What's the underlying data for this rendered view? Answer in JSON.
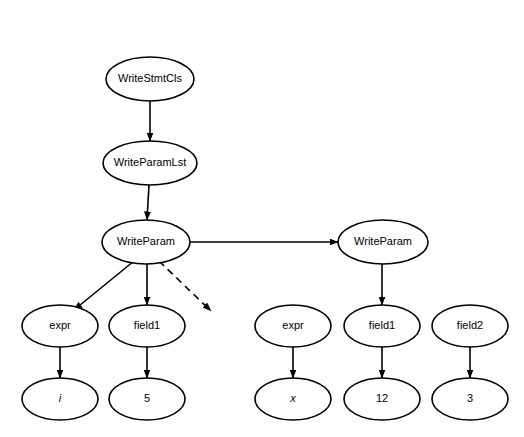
{
  "diagram": {
    "background_color": "#ffffff",
    "stroke_color": "#000000",
    "nodes": [
      {
        "id": "write_stmt_cls",
        "label": "WriteStmtCls",
        "cx": 150,
        "cy": 79,
        "rx": 44,
        "ry": 22,
        "italic": false
      },
      {
        "id": "write_param_lst",
        "label": "WriteParamLst",
        "cx": 150,
        "cy": 163,
        "rx": 47,
        "ry": 22,
        "italic": false
      },
      {
        "id": "write_param_1",
        "label": "WriteParam",
        "cx": 146,
        "cy": 242,
        "rx": 44,
        "ry": 22,
        "italic": false
      },
      {
        "id": "write_param_2",
        "label": "WriteParam",
        "cx": 383,
        "cy": 242,
        "rx": 45,
        "ry": 22,
        "italic": false
      },
      {
        "id": "expr_left",
        "label": "expr",
        "cx": 60,
        "cy": 326,
        "rx": 38,
        "ry": 21,
        "italic": false
      },
      {
        "id": "field1_left",
        "label": "field1",
        "cx": 147,
        "cy": 326,
        "rx": 38,
        "ry": 21,
        "italic": false
      },
      {
        "id": "expr_right",
        "label": "expr",
        "cx": 293,
        "cy": 326,
        "rx": 38,
        "ry": 21,
        "italic": false
      },
      {
        "id": "field1_right",
        "label": "field1",
        "cx": 382,
        "cy": 326,
        "rx": 38,
        "ry": 21,
        "italic": false
      },
      {
        "id": "field2_right",
        "label": "field2",
        "cx": 470,
        "cy": 326,
        "rx": 38,
        "ry": 21,
        "italic": false
      },
      {
        "id": "value_i",
        "label": "i",
        "cx": 60,
        "cy": 399,
        "rx": 38,
        "ry": 21,
        "italic": true
      },
      {
        "id": "value_5",
        "label": "5",
        "cx": 147,
        "cy": 399,
        "rx": 38,
        "ry": 21,
        "italic": false
      },
      {
        "id": "value_x",
        "label": "x",
        "cx": 293,
        "cy": 399,
        "rx": 38,
        "ry": 21,
        "italic": true
      },
      {
        "id": "value_12",
        "label": "12",
        "cx": 382,
        "cy": 399,
        "rx": 38,
        "ry": 21,
        "italic": false
      },
      {
        "id": "value_3",
        "label": "3",
        "cx": 470,
        "cy": 399,
        "rx": 38,
        "ry": 21,
        "italic": false
      }
    ],
    "edges": [
      {
        "id": "e-stmtcls-paramlst",
        "from": "write_stmt_cls",
        "to": "write_param_lst",
        "x1": 150,
        "y1": 101,
        "x2": 150,
        "y2": 141,
        "style": "solid",
        "arrow": true
      },
      {
        "id": "e-paramlst-param1",
        "from": "write_param_lst",
        "to": "write_param_1",
        "x1": 149,
        "y1": 185,
        "x2": 147,
        "y2": 220,
        "style": "solid",
        "arrow": true
      },
      {
        "id": "e-param1-param2",
        "from": "write_param_1",
        "to": "write_param_2",
        "x1": 190,
        "y1": 242,
        "x2": 338,
        "y2": 242,
        "style": "solid",
        "arrow": true
      },
      {
        "id": "e-param1-expr",
        "from": "write_param_1",
        "to": "expr_left",
        "x1": 134,
        "y1": 261,
        "x2": 74,
        "y2": 310,
        "style": "solid",
        "arrow": true
      },
      {
        "id": "e-param1-field1",
        "from": "write_param_1",
        "to": "field1_left",
        "x1": 147,
        "y1": 264,
        "x2": 147,
        "y2": 305,
        "style": "solid",
        "arrow": true
      },
      {
        "id": "e-param1-dashed",
        "from": "write_param_1",
        "to": "continuation",
        "x1": 159,
        "y1": 261,
        "x2": 211,
        "y2": 311,
        "style": "dashed",
        "arrow": true
      },
      {
        "id": "e-param2-field1",
        "from": "write_param_2",
        "to": "field1_right",
        "x1": 382,
        "y1": 264,
        "x2": 382,
        "y2": 305,
        "style": "solid",
        "arrow": true
      },
      {
        "id": "e-exprleft-i",
        "from": "expr_left",
        "to": "value_i",
        "x1": 60,
        "y1": 347,
        "x2": 60,
        "y2": 378,
        "style": "solid",
        "arrow": true
      },
      {
        "id": "e-field1left-5",
        "from": "field1_left",
        "to": "value_5",
        "x1": 147,
        "y1": 347,
        "x2": 147,
        "y2": 378,
        "style": "solid",
        "arrow": true
      },
      {
        "id": "e-exprright-x",
        "from": "expr_right",
        "to": "value_x",
        "x1": 293,
        "y1": 347,
        "x2": 293,
        "y2": 378,
        "style": "solid",
        "arrow": true
      },
      {
        "id": "e-field1right-12",
        "from": "field1_right",
        "to": "value_12",
        "x1": 382,
        "y1": 347,
        "x2": 382,
        "y2": 378,
        "style": "solid",
        "arrow": true
      },
      {
        "id": "e-field2right-3",
        "from": "field2_right",
        "to": "value_3",
        "x1": 470,
        "y1": 347,
        "x2": 470,
        "y2": 378,
        "style": "solid",
        "arrow": true
      }
    ]
  }
}
